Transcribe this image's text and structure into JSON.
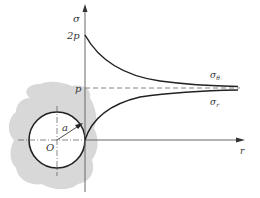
{
  "diagram": {
    "type": "stress-distribution-around-circular-hole",
    "axes": {
      "y_label": "σ",
      "x_label": "r"
    },
    "levels": {
      "two_p": "2p",
      "p": "p"
    },
    "curves": [
      {
        "name": "sigma_theta",
        "label": "σθ",
        "label_main": "σ",
        "label_sub": "θ",
        "start": "2p",
        "asymptote": "p"
      },
      {
        "name": "sigma_r",
        "label": "σr",
        "label_main": "σ",
        "label_sub": "r",
        "start": "0",
        "asymptote": "p"
      }
    ],
    "hole": {
      "center_label": "O",
      "radius_label": "a"
    },
    "colors": {
      "curve": "#222222",
      "axis": "#666666",
      "material": "#d8d8d8",
      "dashed": "#666666"
    }
  }
}
